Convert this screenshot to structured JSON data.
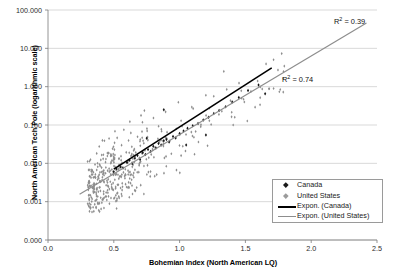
{
  "chart_data": {
    "type": "scatter",
    "title": "",
    "xlabel": "Bohemian Index (North American LQ)",
    "ylabel": "North American Tech Pole (logarithmic scale)",
    "xlim": [
      0.0,
      2.5
    ],
    "ylim_log_decades": [
      "0.000",
      "0.001",
      "0.010",
      "0.100",
      "1.000",
      "10.000",
      "100.000"
    ],
    "xticks": [
      "0.0",
      "0.5",
      "1.0",
      "1.5",
      "2.0",
      "2.5"
    ],
    "yticks": [
      "100.000",
      "10.000",
      "1.000",
      "0.100",
      "0.010",
      "0.001",
      "0.000"
    ],
    "grid": "horizontal",
    "legend_position": "bottom-right",
    "annotations": [
      {
        "text": "R2 = 0.39",
        "r2": 0.39,
        "series": "United States",
        "x": 2.05,
        "y_px": 22
      },
      {
        "text": "R2 = 0.74",
        "r2": 0.74,
        "series": "Canada",
        "x": 1.48,
        "y_px": 79
      }
    ],
    "series": [
      {
        "name": "Canada",
        "marker": "diamond",
        "color": "#1a1a1a",
        "points": [
          [
            0.5,
            0.006
          ],
          [
            0.52,
            0.0072
          ],
          [
            0.55,
            0.008
          ],
          [
            0.57,
            0.0075
          ],
          [
            0.6,
            0.0105
          ],
          [
            0.62,
            0.012
          ],
          [
            0.64,
            0.0098
          ],
          [
            0.66,
            0.0135
          ],
          [
            0.68,
            0.016
          ],
          [
            0.7,
            0.0125
          ],
          [
            0.72,
            0.019
          ],
          [
            0.74,
            0.017
          ],
          [
            0.76,
            0.023
          ],
          [
            0.78,
            0.0205
          ],
          [
            0.8,
            0.028
          ],
          [
            0.82,
            0.025
          ],
          [
            0.84,
            0.033
          ],
          [
            0.86,
            0.03
          ],
          [
            0.88,
            0.039
          ],
          [
            0.9,
            0.042
          ],
          [
            0.92,
            0.036
          ],
          [
            0.95,
            0.05
          ],
          [
            0.97,
            0.046
          ],
          [
            1.0,
            0.06
          ],
          [
            1.03,
            0.07
          ],
          [
            1.06,
            0.082
          ],
          [
            1.1,
            0.095
          ],
          [
            1.14,
            0.11
          ],
          [
            1.18,
            0.135
          ],
          [
            1.22,
            0.16
          ],
          [
            1.26,
            0.2
          ],
          [
            1.3,
            0.24
          ],
          [
            1.35,
            0.3
          ],
          [
            1.4,
            0.4
          ],
          [
            1.45,
            0.52
          ],
          [
            1.52,
            0.8
          ],
          [
            1.6,
            1.1
          ],
          [
            1.65,
            0.65
          ],
          [
            0.88,
            0.25
          ],
          [
            1.05,
            0.03
          ],
          [
            1.2,
            0.055
          ],
          [
            0.75,
            0.045
          ]
        ],
        "trendline": {
          "type": "exponential",
          "r2": 0.74,
          "x_start": 0.5,
          "x_end": 1.7
        }
      },
      {
        "name": "United States",
        "marker": "diamond",
        "color": "#9b9b9b",
        "trendline": {
          "type": "exponential",
          "r2": 0.39,
          "x_start": 0.24,
          "x_end": 2.42
        }
      }
    ],
    "legend_entries": [
      {
        "label": "Canada",
        "type": "marker",
        "color": "#1a1a1a"
      },
      {
        "label": "United States",
        "type": "marker",
        "color": "#9b9b9b"
      },
      {
        "label": "Expon. (Canada)",
        "type": "line",
        "color": "#000000"
      },
      {
        "label": "Expon. (United States)",
        "type": "line",
        "color": "#8d8d8d"
      }
    ]
  }
}
